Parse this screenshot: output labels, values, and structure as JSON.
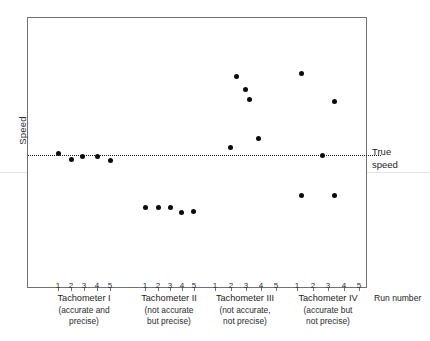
{
  "chart_data": {
    "type": "scatter",
    "title": "",
    "xlabel": "Run number",
    "ylabel": "Speed",
    "grid": false,
    "legend": "none",
    "reference_line": {
      "label_line1": "True",
      "label_line2": "speed",
      "value": 100,
      "style": "dotted"
    },
    "ylim": [
      60,
      145
    ],
    "y_axis_ticks_shown": false,
    "x_categories": [
      "1",
      "2",
      "3",
      "4",
      "5"
    ],
    "groups": [
      {
        "name": "Tachometer I",
        "sub_line1": "(accurate and",
        "sub_line2": "precise)",
        "runs": [
          "1",
          "2",
          "3",
          "4",
          "5"
        ],
        "values": [
          101,
          98.5,
          100,
          100,
          98.5
        ]
      },
      {
        "name": "Tachometer II",
        "sub_line1": "(not accurate",
        "sub_line2": "but precise)",
        "runs": [
          "1",
          "2",
          "3",
          "4",
          "5"
        ],
        "values": [
          84,
          84,
          84,
          82.5,
          83
        ]
      },
      {
        "name": "Tachometer III",
        "sub_line1": "(not accurate,",
        "sub_line2": "not precise)",
        "runs": [
          "1",
          "2",
          "3",
          "4",
          "5"
        ],
        "values": [
          101.5,
          128,
          121,
          118,
          108
        ]
      },
      {
        "name": "Tachometer IV",
        "sub_line1": "(accurate but",
        "sub_line2": "not precise)",
        "runs": [
          "1",
          "2",
          "3",
          "4",
          "5"
        ],
        "values": [
          128,
          85,
          100,
          85,
          119
        ]
      }
    ]
  },
  "colors": {
    "point": "#0b0b0b",
    "frame": "#6f7276",
    "text": "#1f2022",
    "reference_line": "#1b1b1b"
  },
  "points": [
    {
      "name": "tach1-run1",
      "x": 58,
      "y": 153,
      "group": "Tachometer I",
      "run": "1"
    },
    {
      "name": "tach1-run2",
      "x": 71,
      "y": 159,
      "group": "Tachometer I",
      "run": "2"
    },
    {
      "name": "tach1-run3",
      "x": 82,
      "y": 156,
      "group": "Tachometer I",
      "run": "3"
    },
    {
      "name": "tach1-run4",
      "x": 97,
      "y": 156,
      "group": "Tachometer I",
      "run": "4"
    },
    {
      "name": "tach1-run5",
      "x": 110,
      "y": 160,
      "group": "Tachometer I",
      "run": "5"
    },
    {
      "name": "tach2-run1",
      "x": 145,
      "y": 207,
      "group": "Tachometer II",
      "run": "1"
    },
    {
      "name": "tach2-run2",
      "x": 158,
      "y": 207,
      "group": "Tachometer II",
      "run": "2"
    },
    {
      "name": "tach2-run3",
      "x": 170,
      "y": 207,
      "group": "Tachometer II",
      "run": "3"
    },
    {
      "name": "tach2-run4",
      "x": 181,
      "y": 212,
      "group": "Tachometer II",
      "run": "4"
    },
    {
      "name": "tach2-run5",
      "x": 193,
      "y": 211,
      "group": "Tachometer II",
      "run": "5"
    },
    {
      "name": "tach3-run1",
      "x": 230,
      "y": 147,
      "group": "Tachometer III",
      "run": "1"
    },
    {
      "name": "tach3-run2",
      "x": 236,
      "y": 76,
      "group": "Tachometer III",
      "run": "2"
    },
    {
      "name": "tach3-run3",
      "x": 245,
      "y": 89,
      "group": "Tachometer III",
      "run": "3"
    },
    {
      "name": "tach3-run4",
      "x": 249,
      "y": 99,
      "group": "Tachometer III",
      "run": "4"
    },
    {
      "name": "tach3-run5",
      "x": 258,
      "y": 138,
      "group": "Tachometer III",
      "run": "5"
    },
    {
      "name": "tach4-run1",
      "x": 301,
      "y": 73,
      "group": "Tachometer IV",
      "run": "1"
    },
    {
      "name": "tach4-run2",
      "x": 301,
      "y": 195,
      "group": "Tachometer IV",
      "run": "2"
    },
    {
      "name": "tach4-run3",
      "x": 322,
      "y": 155,
      "group": "Tachometer IV",
      "run": "3"
    },
    {
      "name": "tach4-run4",
      "x": 334,
      "y": 195,
      "group": "Tachometer IV",
      "run": "4"
    },
    {
      "name": "tach4-run5",
      "x": 334,
      "y": 101,
      "group": "Tachometer IV",
      "run": "5"
    }
  ],
  "ticks": [
    {
      "group": 0,
      "label": "1",
      "x": 58
    },
    {
      "group": 0,
      "label": "2",
      "x": 71
    },
    {
      "group": 0,
      "label": "3",
      "x": 84
    },
    {
      "group": 0,
      "label": "4",
      "x": 97
    },
    {
      "group": 0,
      "label": "5",
      "x": 110
    },
    {
      "group": 1,
      "label": "1",
      "x": 145
    },
    {
      "group": 1,
      "label": "2",
      "x": 158
    },
    {
      "group": 1,
      "label": "3",
      "x": 170
    },
    {
      "group": 1,
      "label": "4",
      "x": 182
    },
    {
      "group": 1,
      "label": "5",
      "x": 194
    },
    {
      "group": 2,
      "label": "1",
      "x": 215
    },
    {
      "group": 2,
      "label": "2",
      "x": 231
    },
    {
      "group": 2,
      "label": "3",
      "x": 246
    },
    {
      "group": 2,
      "label": "4",
      "x": 261
    },
    {
      "group": 2,
      "label": "5",
      "x": 276
    },
    {
      "group": 3,
      "label": "1",
      "x": 297
    },
    {
      "group": 3,
      "label": "2",
      "x": 313
    },
    {
      "group": 3,
      "label": "3",
      "x": 328
    },
    {
      "group": 3,
      "label": "4",
      "x": 344
    },
    {
      "group": 3,
      "label": "5",
      "x": 359
    }
  ],
  "group_caption_x": [
    84,
    169,
    245,
    328
  ]
}
